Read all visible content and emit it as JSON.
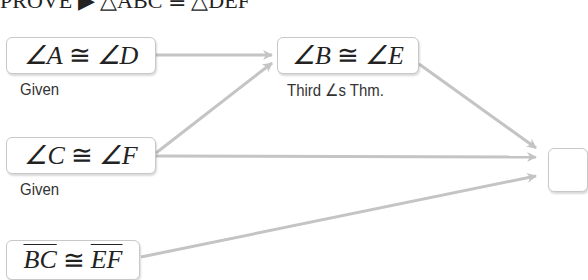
{
  "title": {
    "text": "PROVE ▶ △ABC ≅ △DEF"
  },
  "statements": [
    {
      "left": "∠A",
      "op": "≅",
      "right": "∠D",
      "reason": "Given"
    },
    {
      "left": "∠B",
      "op": "≅",
      "right": "∠E",
      "reason": "Third ∠s Thm."
    },
    {
      "left": "∠C",
      "op": "≅",
      "right": "∠F",
      "reason": "Given"
    },
    {
      "left": "BC",
      "op": "≅",
      "right": "EF",
      "reason": ""
    }
  ],
  "arrows": [
    {
      "from": "∠A ≅ ∠D",
      "to": "∠B ≅ ∠E"
    },
    {
      "from": "∠C ≅ ∠F",
      "to": "∠B ≅ ∠E"
    },
    {
      "from": "∠B ≅ ∠E",
      "to": "conclusion"
    },
    {
      "from": "∠C ≅ ∠F",
      "to": "conclusion"
    },
    {
      "from": "BC ≅ EF",
      "to": "conclusion"
    }
  ],
  "colors": {
    "arrow": "#c4c4c4",
    "box_border": "#c8c8c8",
    "text": "#222222"
  }
}
